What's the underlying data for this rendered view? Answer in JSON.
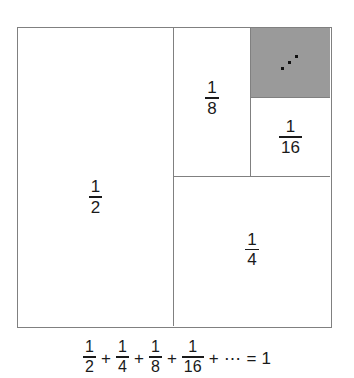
{
  "figure": {
    "colors": {
      "outline": "#808080",
      "shaded_fill": "#9a9a9a",
      "background": "#ffffff",
      "text": "#1a1a1a"
    },
    "regions": [
      {
        "name": "half",
        "numerator": "1",
        "denominator": "2",
        "value": 0.5,
        "shaded": false
      },
      {
        "name": "quarter",
        "numerator": "1",
        "denominator": "4",
        "value": 0.25,
        "shaded": false
      },
      {
        "name": "eighth",
        "numerator": "1",
        "denominator": "8",
        "value": 0.125,
        "shaded": false
      },
      {
        "name": "sixteenth",
        "numerator": "1",
        "denominator": "16",
        "value": 0.0625,
        "shaded": false
      },
      {
        "name": "remainder",
        "numerator": "",
        "denominator": "",
        "value": 0.0625,
        "shaded": true,
        "ellipsis": "diagonal-three-dots"
      }
    ],
    "equation": {
      "terms": [
        {
          "numerator": "1",
          "denominator": "2"
        },
        {
          "numerator": "1",
          "denominator": "4"
        },
        {
          "numerator": "1",
          "denominator": "8"
        },
        {
          "numerator": "1",
          "denominator": "16"
        }
      ],
      "plus": "+",
      "ellipsis": "⋯",
      "equals": "=",
      "result": "1",
      "plain_text": "1/2 + 1/4 + 1/8 + 1/16 + ⋯ = 1"
    }
  }
}
